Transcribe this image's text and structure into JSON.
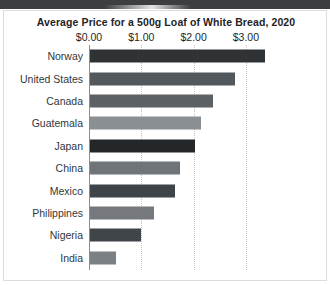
{
  "chart_data": {
    "type": "bar",
    "orientation": "horizontal",
    "title": "Average Price for a 500g Loaf of White Bread, 2020",
    "xlabel": "",
    "ylabel": "",
    "xlim": [
      0,
      3.6
    ],
    "grid": true,
    "legend": "none",
    "tick_labels": [
      "$0.00",
      "$1.00",
      "$2.00",
      "$3.00"
    ],
    "tick_values": [
      0,
      1,
      2,
      3
    ],
    "categories": [
      "Norway",
      "United States",
      "Canada",
      "Guatemala",
      "Japan",
      "China",
      "Mexico",
      "Philippines",
      "Nigeria",
      "India"
    ],
    "values": [
      3.35,
      2.78,
      2.35,
      2.12,
      2.0,
      1.72,
      1.62,
      1.23,
      0.97,
      0.49
    ],
    "bar_colors": [
      "#2f3336",
      "#53585c",
      "#5c6165",
      "#8a8f93",
      "#23272a",
      "#6f7478",
      "#3f4448",
      "#75797d",
      "#40454a",
      "#7b8084"
    ],
    "bars": [
      {
        "label": "Norway",
        "value": 3.35,
        "color": "#2f3336"
      },
      {
        "label": "United States",
        "value": 2.78,
        "color": "#53585c"
      },
      {
        "label": "Canada",
        "value": 2.35,
        "color": "#5c6165"
      },
      {
        "label": "Guatemala",
        "value": 2.12,
        "color": "#8a8f93"
      },
      {
        "label": "Japan",
        "value": 2.0,
        "color": "#23272a"
      },
      {
        "label": "China",
        "value": 1.72,
        "color": "#6f7478"
      },
      {
        "label": "Mexico",
        "value": 1.62,
        "color": "#3f4448"
      },
      {
        "label": "Philippines",
        "value": 1.23,
        "color": "#75797d"
      },
      {
        "label": "Nigeria",
        "value": 0.97,
        "color": "#40454a"
      },
      {
        "label": "India",
        "value": 0.49,
        "color": "#7b8084"
      }
    ]
  },
  "colors": {
    "top_band": "#3b3f42",
    "card_border": "#dcdcdc",
    "axis": "#8a8f93",
    "gridline": "#c4c4c4",
    "title_text": "#1f2326",
    "label_text": "#31373b"
  }
}
